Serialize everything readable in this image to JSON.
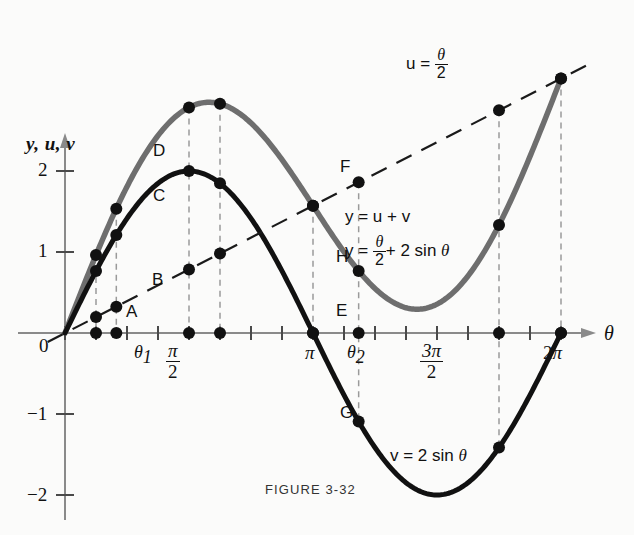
{
  "header": {
    "partial_text": ""
  },
  "figure": {
    "caption": "FIGURE  3-32",
    "y_axis_title": "y, u, v",
    "x_axis_title": "θ",
    "origin_label": "0"
  },
  "y_ticks": [
    {
      "label": "2",
      "value": 2
    },
    {
      "label": "1",
      "value": 1
    },
    {
      "label": "−1",
      "value": -1
    },
    {
      "label": "−2",
      "value": -2
    }
  ],
  "x_ticks": [
    {
      "label": "θ₁",
      "value": 0.65,
      "kind": "theta1"
    },
    {
      "label": "π/2",
      "value": 1.5708,
      "kind": "frac",
      "num": "π",
      "den": "2"
    },
    {
      "label": "π",
      "value": 3.1416,
      "kind": "plain"
    },
    {
      "label": "θ₂",
      "value": 3.72,
      "kind": "theta2"
    },
    {
      "label": "3π/2",
      "value": 4.7124,
      "kind": "frac",
      "num": "3π",
      "den": "2"
    },
    {
      "label": "2π",
      "value": 6.2832,
      "kind": "plain"
    }
  ],
  "equations": {
    "u_line": "u = θ/2",
    "y_sum": "y = u + v",
    "y_expanded": "y = θ/2 + 2 sin θ",
    "v_curve": "v = 2 sin θ"
  },
  "point_labels": [
    {
      "id": "A",
      "at": "theta1",
      "on": "x-axis",
      "value": 0
    },
    {
      "id": "B",
      "at": "theta1",
      "on": "u-line",
      "value": 0.325
    },
    {
      "id": "C",
      "at": "theta1",
      "on": "v-curve",
      "value": 1.21
    },
    {
      "id": "D",
      "at": "theta1",
      "on": "y-curve",
      "value": 1.535
    },
    {
      "id": "E",
      "at": "theta2",
      "on": "x-axis",
      "value": 0
    },
    {
      "id": "F",
      "at": "theta2",
      "on": "u-line",
      "value": 1.86
    },
    {
      "id": "G",
      "at": "theta2",
      "on": "v-curve",
      "value": -1.07
    },
    {
      "id": "H",
      "at": "theta2",
      "on": "y-curve",
      "value": 0.93
    }
  ],
  "colors": {
    "v_curve": "#111111",
    "y_curve": "#6e6e6e",
    "u_line": "#1a1a1a",
    "axis": "#8a8a8a",
    "dashed_guide": "#9a9a9a",
    "background": "#fbfbfa"
  },
  "chart_data": {
    "type": "line",
    "title": "FIGURE  3-32",
    "xlabel": "θ",
    "ylabel": "y, u, v",
    "xlim": [
      -0.25,
      6.75
    ],
    "ylim": [
      -2.45,
      2.6
    ],
    "grid": false,
    "legend": "inline-annotations",
    "xtick_values": [
      0,
      0.3927,
      0.7854,
      1.1781,
      1.5708,
      1.9635,
      2.3562,
      2.7489,
      3.1416,
      3.5343,
      3.927,
      4.3197,
      4.7124,
      5.1051,
      5.4978,
      5.8905,
      6.2832
    ],
    "xtick_labels": [
      "0",
      "",
      "",
      "",
      "π/2",
      "",
      "",
      "",
      "π",
      "",
      "",
      "",
      "3π/2",
      "",
      "",
      "",
      "2π"
    ],
    "ytick_values": [
      2,
      1,
      -1,
      -2
    ],
    "ytick_labels": [
      "2",
      "1",
      "−1",
      "−2"
    ],
    "series": [
      {
        "name": "v = 2 sin θ",
        "color": "#111111",
        "style": "solid-thick",
        "formula": "2*sin(theta)",
        "sample_x": [
          0,
          0.3927,
          0.65,
          0.7854,
          1.1781,
          1.5708,
          1.9635,
          2.3562,
          2.7489,
          3.1416,
          3.5343,
          3.72,
          3.927,
          4.3197,
          4.7124,
          5.1051,
          5.4978,
          5.8905,
          6.2832
        ],
        "sample_y": [
          0,
          0.765,
          1.21,
          1.414,
          1.848,
          2.0,
          1.848,
          1.414,
          0.765,
          0,
          -0.765,
          -1.07,
          -1.414,
          -1.848,
          -2.0,
          -1.848,
          -1.414,
          -0.765,
          0
        ]
      },
      {
        "name": "u = θ/2",
        "color": "#1a1a1a",
        "style": "dashed",
        "formula": "theta/2",
        "sample_x": [
          0,
          0.3927,
          0.65,
          1.5708,
          3.1416,
          3.72,
          4.7124,
          6.2832
        ],
        "sample_y": [
          0,
          0.196,
          0.325,
          0.785,
          1.571,
          1.86,
          2.356,
          3.142
        ]
      },
      {
        "name": "y = θ/2 + 2 sin θ",
        "color": "#6e6e6e",
        "style": "solid-thick",
        "formula": "theta/2 + 2*sin(theta)",
        "sample_x": [
          0,
          0.3927,
          0.65,
          0.7854,
          1.1781,
          1.5708,
          1.9635,
          2.3562,
          2.7489,
          3.1416,
          3.5343,
          3.72,
          3.927,
          4.3197,
          4.7124,
          5.1051,
          5.4978,
          5.8905,
          6.2832
        ],
        "sample_y": [
          0,
          0.961,
          1.535,
          1.807,
          2.437,
          2.785,
          2.83,
          2.592,
          2.139,
          1.571,
          1.002,
          0.93,
          0.55,
          0.312,
          0.356,
          0.705,
          1.335,
          2.181,
          3.142
        ]
      }
    ],
    "marked_points": [
      {
        "label": "A",
        "x": 0.65,
        "y": 0
      },
      {
        "label": "B",
        "x": 0.65,
        "y": 0.325
      },
      {
        "label": "C",
        "x": 0.65,
        "y": 1.21
      },
      {
        "label": "D",
        "x": 0.65,
        "y": 1.535
      },
      {
        "label": "E",
        "x": 3.72,
        "y": 0
      },
      {
        "label": "F",
        "x": 3.72,
        "y": 1.86
      },
      {
        "label": "G",
        "x": 3.72,
        "y": -1.07
      },
      {
        "label": "H",
        "x": 3.72,
        "y": 0.93
      }
    ],
    "annotations": [
      {
        "text": "u = θ/2",
        "x": 4.1,
        "y": 2.45
      },
      {
        "text": "y = u + v",
        "x": 3.85,
        "y": 1.45
      },
      {
        "text": "y = θ/2 + 2 sin θ",
        "x": 3.85,
        "y": 1.05
      },
      {
        "text": "v = 2 sin θ",
        "x": 4.5,
        "y": -1.72
      }
    ]
  }
}
